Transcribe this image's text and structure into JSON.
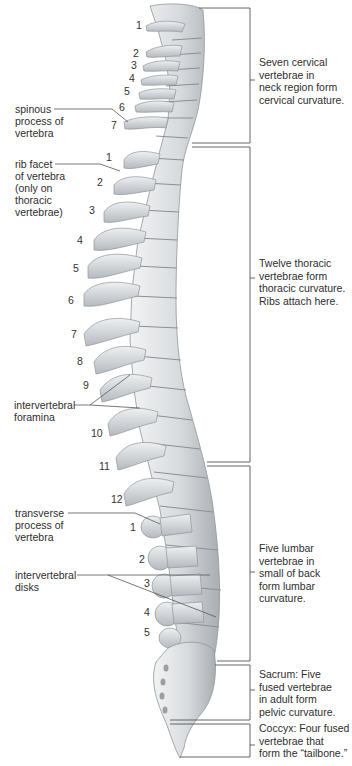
{
  "diagram": {
    "colors": {
      "bone": "#d9dcdf",
      "bone_shadow": "#9aa0a6",
      "line": "#555555",
      "text": "#2e2e2e"
    },
    "left_labels": [
      {
        "id": "spinous",
        "text": "spinous\nprocess of\nvertebra"
      },
      {
        "id": "rib-facet",
        "text": "rib facet\nof vertebra\n(only on\nthoracic\nvertebrae)"
      },
      {
        "id": "intervertebral-foramina",
        "text": "intervertebral\nforamina"
      },
      {
        "id": "transverse",
        "text": "transverse\nprocess of\nvertebra"
      },
      {
        "id": "intervertebral-disks",
        "text": "intervertebral\ndisks"
      }
    ],
    "regions": [
      {
        "id": "cervical",
        "text": "Seven cervical\nvertebrae in\nneck region form\ncervical curvature."
      },
      {
        "id": "thoracic",
        "text": "Twelve thoracic\nvertebrae form\nthoracic curvature.\nRibs attach here."
      },
      {
        "id": "lumbar",
        "text": "Five lumbar\nvertebrae in\nsmall of back\nform lumbar\ncurvature."
      },
      {
        "id": "sacrum",
        "text": "Sacrum: Five\nfused vertebrae\nin adult form\npelvic curvature."
      },
      {
        "id": "coccyx",
        "text": "Coccyx: Four fused\nvertebrae that\nform the “tailbone.”"
      }
    ],
    "cervical_numbers": [
      "1",
      "2",
      "3",
      "4",
      "5",
      "6",
      "7"
    ],
    "thoracic_numbers": [
      "1",
      "2",
      "3",
      "4",
      "5",
      "6",
      "7",
      "8",
      "9",
      "10",
      "11",
      "12"
    ],
    "lumbar_numbers": [
      "1",
      "2",
      "3",
      "4",
      "5"
    ]
  }
}
